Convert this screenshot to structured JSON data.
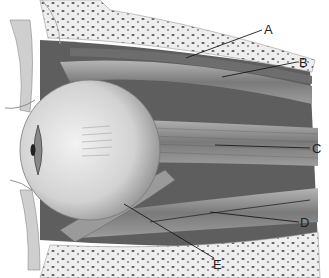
{
  "figure": {
    "colors": {
      "bone": "#ececec",
      "muscle": "#8a8a8a",
      "eyeball": "#d8d8d8",
      "background": "#ffffff",
      "leader": "#1a1a1a"
    },
    "labels": [
      {
        "id": "A",
        "text": "A",
        "x": 264,
        "y": 23,
        "line": [
          186,
          58,
          262,
          30
        ]
      },
      {
        "id": "B",
        "text": "B",
        "x": 299,
        "y": 56,
        "line": [
          222,
          77,
          297,
          62
        ]
      },
      {
        "id": "C",
        "text": "C",
        "x": 312,
        "y": 142,
        "line": [
          215,
          145,
          310,
          148
        ]
      },
      {
        "id": "D",
        "text": "D",
        "x": 300,
        "y": 216,
        "line": [
          210,
          212,
          299,
          222
        ]
      },
      {
        "id": "E",
        "text": "E",
        "x": 213,
        "y": 258,
        "line": [
          124,
          204,
          214,
          258
        ]
      }
    ]
  }
}
